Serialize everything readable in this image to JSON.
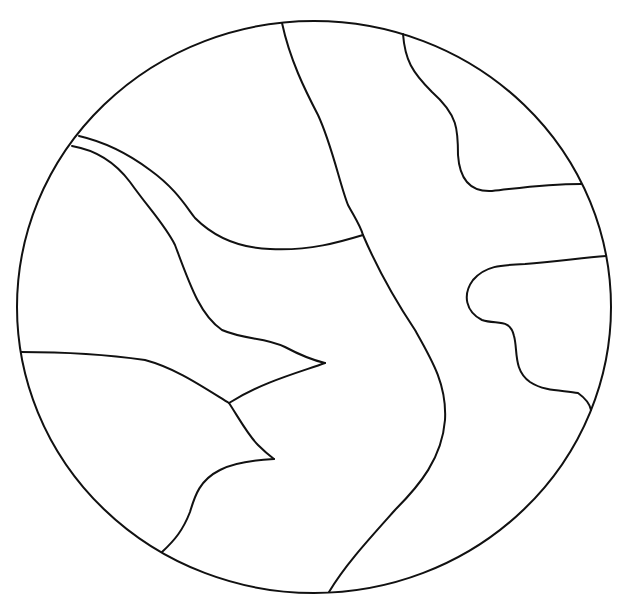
{
  "diagram": {
    "type": "outline-map",
    "canvas": {
      "width": 623,
      "height": 607,
      "background": "#ffffff"
    },
    "stroke": {
      "color": "#111111",
      "width": 2
    },
    "boundary": {
      "shape": "ellipse",
      "cx": 314,
      "cy": 307,
      "rx": 297,
      "ry": 286
    },
    "lines": [
      {
        "id": "river-center",
        "d": "M282 23 C 290 60, 305 90, 318 115 C 332 145, 340 185, 348 205 C 355 218, 360 225, 363 235 C 378 270, 395 300, 415 330 C 432 360, 447 385, 445 420 C 442 458, 420 485, 395 510 C 370 538, 345 565, 329 592"
      },
      {
        "id": "river-upper-right",
        "d": "M403 34 C 405 60, 412 72, 432 92 C 458 115, 458 130, 458 155 C 460 185, 475 192, 492 191 C 520 188, 545 184, 581 184"
      },
      {
        "id": "upper-left-boundary-outer",
        "d": "M79 136 C 105 142, 130 155, 150 170 C 175 188, 185 205, 195 218 C 215 238, 240 248, 270 249 C 310 251, 340 242, 363 235"
      },
      {
        "id": "upper-left-boundary-inner",
        "d": "M72 146 C 95 150, 115 162, 130 182 C 150 210, 165 225, 175 245 C 190 285, 200 315, 222 330 C 245 340, 265 337, 285 347 C 300 355, 312 360, 325 363"
      },
      {
        "id": "spur-middle",
        "d": "M325 363 C 300 372, 262 382, 229 403"
      },
      {
        "id": "lower-left-boundary",
        "d": "M21 352 C 60 352, 110 355, 145 360 C 175 368, 200 385, 229 403 C 240 420, 248 435, 258 445 C 265 452, 270 456, 274 459"
      },
      {
        "id": "lower-left-spur",
        "d": "M274 459 C 255 460, 235 462, 220 470 C 200 480, 195 495, 190 512 C 183 530, 175 540, 162 552"
      },
      {
        "id": "right-peninsula",
        "d": "M606 256 C 580 258, 555 262, 525 264 C 500 265, 485 266, 473 280 C 462 295, 466 312, 482 320 C 497 325, 510 318, 514 336 C 518 350, 513 370, 530 382 C 545 392, 565 390, 578 393 C 585 398, 590 405, 591 410"
      }
    ]
  }
}
